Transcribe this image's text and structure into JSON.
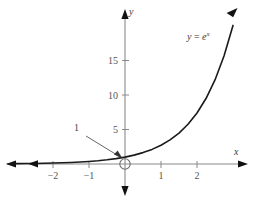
{
  "figure": {
    "title": "",
    "background": "#ffffff",
    "curve_color": "#1a1a1a",
    "axis_color": "#8a8a8a",
    "label_color": "#3b3b3b"
  },
  "labels": {
    "x_axis": "x",
    "y_axis": "y",
    "equation_lhs": "y",
    "equation_eq": "=",
    "equation_base": "e",
    "equation_exp": "x",
    "intercept_annotation": "1"
  },
  "chart_data": {
    "type": "line",
    "title": "",
    "xlabel": "x",
    "ylabel": "y",
    "legend": [
      "y = e^x"
    ],
    "legend_position": "upper-right-inline",
    "grid": false,
    "xlim": [
      -3.25,
      3.5
    ],
    "ylim": [
      -4.2,
      22.0
    ],
    "xticks": [
      -2,
      -1,
      1,
      2
    ],
    "xtick_labels": [
      "−2",
      "−1",
      "1",
      "2"
    ],
    "yticks": [
      5,
      10,
      15
    ],
    "ytick_labels": [
      "5",
      "10",
      "15"
    ],
    "annotations": [
      {
        "text": "1",
        "points_to_x": 0,
        "points_to_y": 1,
        "label_x": -1.3,
        "label_y": 5.1
      }
    ],
    "markers": [
      {
        "type": "open-circle",
        "x": 0,
        "y": 0,
        "name": "origin-marker"
      }
    ],
    "series": [
      {
        "name": "y = e^x",
        "expression": "e^x",
        "x": [
          -3.25,
          -3.0,
          -2.75,
          -2.5,
          -2.25,
          -2.0,
          -1.75,
          -1.5,
          -1.25,
          -1.0,
          -0.75,
          -0.5,
          -0.25,
          0.0,
          0.25,
          0.5,
          0.75,
          1.0,
          1.25,
          1.5,
          1.75,
          2.0,
          2.25,
          2.5,
          2.75,
          3.0
        ],
        "y": [
          0.039,
          0.05,
          0.064,
          0.082,
          0.105,
          0.135,
          0.174,
          0.223,
          0.287,
          0.368,
          0.472,
          0.607,
          0.779,
          1.0,
          1.284,
          1.649,
          2.117,
          2.718,
          3.49,
          4.482,
          5.755,
          7.389,
          9.488,
          12.182,
          15.643,
          20.086
        ]
      }
    ]
  }
}
